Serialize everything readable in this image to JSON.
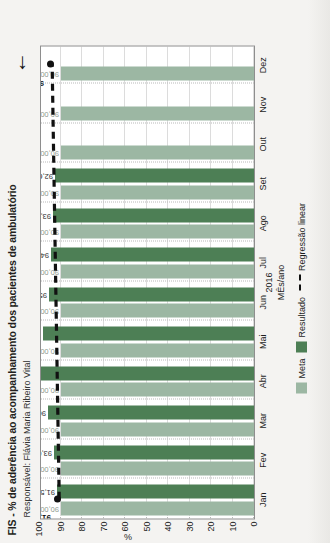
{
  "chart_data": {
    "type": "bar",
    "title": "FIS - % de aderência ao acompanhamento dos pacientes de ambulatório",
    "subtitle": "Responsável: Flávia Maria Ribeiro Vital",
    "xlabel": "MÊs/ano",
    "year": "2016",
    "ylabel": "%",
    "ylim": [
      0,
      100
    ],
    "yticks": [
      "0",
      "10",
      "20",
      "30",
      "40",
      "50",
      "60",
      "70",
      "80",
      "90",
      "100"
    ],
    "ytick_values": [
      0,
      10,
      20,
      30,
      40,
      50,
      60,
      70,
      80,
      90,
      100
    ],
    "grid": true,
    "legend_position": "bottom",
    "categories": [
      "Jan",
      "Fev",
      "Mar",
      "Abr",
      "Mai",
      "Jun",
      "Jul",
      "Ago",
      "Set",
      "Out",
      "Nov",
      "Dez"
    ],
    "series": [
      {
        "name": "Meta",
        "color": "#9cb7a3",
        "values": [
          90.0,
          90.0,
          90.0,
          90.0,
          90.0,
          90.0,
          90.0,
          90.0,
          90.0,
          90.0,
          90.0,
          90.0
        ],
        "labels": [
          "90,00",
          "90,00",
          "90,00",
          "90,00",
          "90,00",
          "90,00",
          "90,00",
          "90,00",
          "90,00",
          "90,00",
          "90,00",
          "90,00"
        ]
      },
      {
        "name": "Resultado",
        "color": "#4d7f55",
        "values": [
          91.53,
          93.0,
          96.0,
          100.0,
          98.0,
          95.2,
          94.4,
          93.5,
          92.6,
          0.0,
          0.0,
          0.0
        ],
        "labels": [
          "91,53",
          "93,00",
          "96,00",
          "100,00",
          "98,00",
          "95,20",
          "94,40",
          "93,50",
          "92,60",
          "",
          "",
          ""
        ]
      }
    ],
    "regression": {
      "name": "Regressão linear",
      "style": "dashed",
      "color": "#111111",
      "start_value": 91.53,
      "end_value": 94.81,
      "start_label": "91,53",
      "end_label": "94,81"
    },
    "annotations": [
      {
        "name": "highlight-arrow",
        "glyph": "←",
        "target": "94,81"
      }
    ]
  },
  "legend": {
    "meta_label": "Meta",
    "result_label": "Resultado",
    "regression_label": "Regressão linear",
    "dash_glyph": "—"
  }
}
